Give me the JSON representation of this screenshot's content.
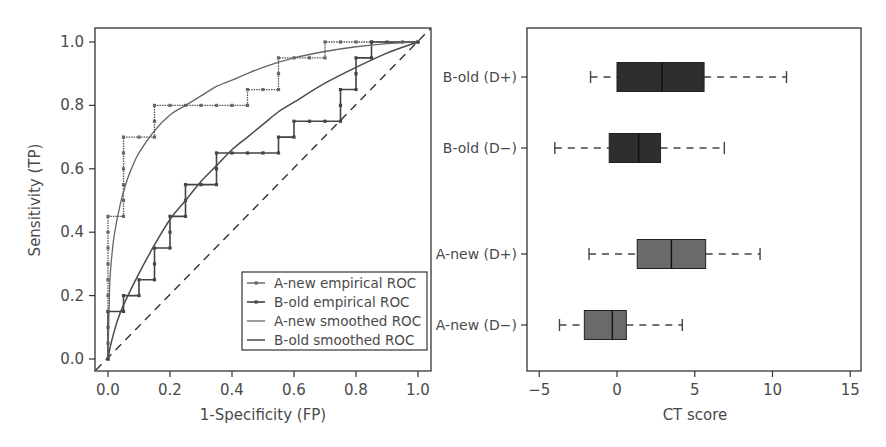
{
  "chart_data": [
    {
      "type": "line",
      "title": "",
      "xlabel": "1-Specificity (FP)",
      "ylabel": "Sensitivity (TP)",
      "xlim": [
        0,
        1
      ],
      "ylim": [
        0,
        1
      ],
      "xticks": [
        "0.0",
        "0.2",
        "0.4",
        "0.6",
        "0.8",
        "1.0"
      ],
      "yticks": [
        "0.0",
        "0.2",
        "0.4",
        "0.6",
        "0.8",
        "1.0"
      ],
      "grid": false,
      "legend_position": "lower right",
      "reference_line": {
        "name": "chance diagonal",
        "style": "dashed",
        "from": [
          0,
          0
        ],
        "to": [
          1,
          1
        ]
      },
      "series": [
        {
          "name": "A-new empirical ROC",
          "style": "step-with-markers",
          "points": [
            [
              0,
              0
            ],
            [
              0,
              0.05
            ],
            [
              0,
              0.1
            ],
            [
              0,
              0.15
            ],
            [
              0,
              0.2
            ],
            [
              0,
              0.25
            ],
            [
              0,
              0.3
            ],
            [
              0,
              0.35
            ],
            [
              0,
              0.4
            ],
            [
              0,
              0.45
            ],
            [
              0.05,
              0.45
            ],
            [
              0.05,
              0.5
            ],
            [
              0.05,
              0.55
            ],
            [
              0.05,
              0.6
            ],
            [
              0.05,
              0.65
            ],
            [
              0.05,
              0.7
            ],
            [
              0.1,
              0.7
            ],
            [
              0.15,
              0.7
            ],
            [
              0.15,
              0.75
            ],
            [
              0.15,
              0.8
            ],
            [
              0.2,
              0.8
            ],
            [
              0.25,
              0.8
            ],
            [
              0.3,
              0.8
            ],
            [
              0.35,
              0.8
            ],
            [
              0.4,
              0.8
            ],
            [
              0.45,
              0.8
            ],
            [
              0.45,
              0.85
            ],
            [
              0.5,
              0.85
            ],
            [
              0.55,
              0.85
            ],
            [
              0.55,
              0.9
            ],
            [
              0.55,
              0.95
            ],
            [
              0.6,
              0.95
            ],
            [
              0.65,
              0.95
            ],
            [
              0.7,
              0.95
            ],
            [
              0.7,
              1.0
            ],
            [
              0.75,
              1.0
            ],
            [
              0.8,
              1.0
            ],
            [
              0.85,
              1.0
            ],
            [
              0.9,
              1.0
            ],
            [
              0.95,
              1.0
            ],
            [
              1.0,
              1.0
            ]
          ]
        },
        {
          "name": "B-old empirical ROC",
          "style": "step-with-markers",
          "points": [
            [
              0,
              0
            ],
            [
              0,
              0.15
            ],
            [
              0.05,
              0.15
            ],
            [
              0.05,
              0.2
            ],
            [
              0.1,
              0.2
            ],
            [
              0.1,
              0.25
            ],
            [
              0.15,
              0.25
            ],
            [
              0.15,
              0.3
            ],
            [
              0.15,
              0.35
            ],
            [
              0.2,
              0.35
            ],
            [
              0.2,
              0.4
            ],
            [
              0.2,
              0.45
            ],
            [
              0.25,
              0.45
            ],
            [
              0.25,
              0.5
            ],
            [
              0.25,
              0.55
            ],
            [
              0.3,
              0.55
            ],
            [
              0.35,
              0.55
            ],
            [
              0.35,
              0.6
            ],
            [
              0.35,
              0.65
            ],
            [
              0.4,
              0.65
            ],
            [
              0.45,
              0.65
            ],
            [
              0.5,
              0.65
            ],
            [
              0.55,
              0.65
            ],
            [
              0.55,
              0.7
            ],
            [
              0.6,
              0.7
            ],
            [
              0.6,
              0.75
            ],
            [
              0.65,
              0.75
            ],
            [
              0.7,
              0.75
            ],
            [
              0.75,
              0.75
            ],
            [
              0.75,
              0.8
            ],
            [
              0.75,
              0.85
            ],
            [
              0.8,
              0.85
            ],
            [
              0.8,
              0.9
            ],
            [
              0.8,
              0.95
            ],
            [
              0.85,
              0.95
            ],
            [
              0.85,
              1.0
            ],
            [
              1.0,
              1.0
            ]
          ]
        },
        {
          "name": "A-new smoothed ROC",
          "style": "smooth",
          "points": [
            [
              0,
              0
            ],
            [
              0.005,
              0.22
            ],
            [
              0.01,
              0.3
            ],
            [
              0.02,
              0.39
            ],
            [
              0.04,
              0.49
            ],
            [
              0.06,
              0.56
            ],
            [
              0.08,
              0.61
            ],
            [
              0.1,
              0.65
            ],
            [
              0.15,
              0.72
            ],
            [
              0.2,
              0.77
            ],
            [
              0.25,
              0.8
            ],
            [
              0.3,
              0.83
            ],
            [
              0.35,
              0.86
            ],
            [
              0.4,
              0.88
            ],
            [
              0.5,
              0.92
            ],
            [
              0.6,
              0.95
            ],
            [
              0.7,
              0.97
            ],
            [
              0.8,
              0.985
            ],
            [
              0.9,
              0.995
            ],
            [
              1.0,
              1.0
            ]
          ]
        },
        {
          "name": "B-old smoothed ROC",
          "style": "smooth",
          "points": [
            [
              0,
              0
            ],
            [
              0.01,
              0.05
            ],
            [
              0.03,
              0.12
            ],
            [
              0.05,
              0.17
            ],
            [
              0.1,
              0.27
            ],
            [
              0.15,
              0.36
            ],
            [
              0.2,
              0.44
            ],
            [
              0.25,
              0.5
            ],
            [
              0.3,
              0.56
            ],
            [
              0.35,
              0.61
            ],
            [
              0.4,
              0.66
            ],
            [
              0.45,
              0.7
            ],
            [
              0.5,
              0.74
            ],
            [
              0.55,
              0.78
            ],
            [
              0.6,
              0.81
            ],
            [
              0.7,
              0.87
            ],
            [
              0.8,
              0.92
            ],
            [
              0.9,
              0.965
            ],
            [
              1.0,
              1.0
            ]
          ]
        }
      ],
      "legend": [
        "A-new empirical ROC",
        "B-old empirical ROC",
        "A-new smoothed ROC",
        "B-old smoothed ROC"
      ]
    },
    {
      "type": "boxplot",
      "orientation": "horizontal",
      "title": "",
      "xlabel": "CT score",
      "ylabel": "",
      "xlim": [
        -5.5,
        16
      ],
      "xticks": [
        "−5",
        "0",
        "5",
        "10",
        "15"
      ],
      "xtick_values": [
        -5,
        0,
        5,
        10,
        15
      ],
      "grid": false,
      "categories": [
        "B-old (D+)",
        "B-old (D−)",
        "A-new (D+)",
        "A-new (D−)"
      ],
      "boxes": [
        {
          "label": "B-old (D+)",
          "whisker_low": -1.7,
          "q1": 0.0,
          "median": 2.9,
          "q3": 5.6,
          "whisker_high": 10.9,
          "color": "#2e2e2e"
        },
        {
          "label": "B-old (D−)",
          "whisker_low": -4.0,
          "q1": -0.5,
          "median": 1.4,
          "q3": 2.8,
          "whisker_high": 6.9,
          "color": "#2e2e2e"
        },
        {
          "label": "A-new (D+)",
          "whisker_low": -1.8,
          "q1": 1.3,
          "median": 3.5,
          "q3": 5.7,
          "whisker_high": 9.2,
          "color": "#6a6a6a"
        },
        {
          "label": "A-new (D−)",
          "whisker_low": -3.7,
          "q1": -2.1,
          "median": -0.3,
          "q3": 0.6,
          "whisker_high": 4.2,
          "color": "#6a6a6a"
        }
      ]
    }
  ],
  "colors": {
    "axis": "#333333",
    "text": "#4a4a4a",
    "line": "#5a5a5a",
    "dark_box": "#2e2e2e",
    "light_box": "#6a6a6a"
  }
}
